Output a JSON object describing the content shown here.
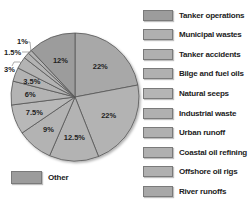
{
  "chart_data": {
    "type": "pie",
    "title": "",
    "categories": [
      "Tanker operations",
      "Municipal wastes",
      "Tanker accidents",
      "Bilge and fuel oils",
      "Natural seeps",
      "Industrial waste",
      "Urban runoff",
      "Coastal oil refining",
      "Offshore oil rigs",
      "River runoffs",
      "Other"
    ],
    "values": [
      22,
      22,
      12.5,
      9,
      7.5,
      6,
      3.5,
      3,
      1.5,
      1,
      12
    ],
    "labels": [
      "22%",
      "22%",
      "12.5%",
      "9%",
      "7.5%",
      "6%",
      "3.5%",
      "3%",
      "1.5%",
      "1%",
      "12%"
    ],
    "legend_position": "right",
    "colors": [
      "#a8a8a8",
      "#b3b3b3",
      "#b3b3b3",
      "#b3b3b3",
      "#b8b8b8",
      "#b3b3b3",
      "#b3b3b3",
      "#b3b3b3",
      "#b3b3b3",
      "#b3b3b3",
      "#9c9c9c"
    ]
  },
  "legend": {
    "items": [
      {
        "label": "Tanker operations",
        "color": "#9c9c9c"
      },
      {
        "label": "Municipal wastes",
        "color": "#b0b0b0"
      },
      {
        "label": "Tanker accidents",
        "color": "#b0b0b0"
      },
      {
        "label": "Bilge and fuel oils",
        "color": "#b0b0b0"
      },
      {
        "label": "Natural seeps",
        "color": "#b5b5b5"
      },
      {
        "label": "Industrial waste",
        "color": "#b0b0b0"
      },
      {
        "label": "Urban runoff",
        "color": "#b0b0b0"
      },
      {
        "label": "Coastal oil refining",
        "color": "#b0b0b0"
      },
      {
        "label": "Offshore oil rigs",
        "color": "#b0b0b0"
      },
      {
        "label": "River runoffs",
        "color": "#a8a8a8"
      }
    ],
    "other": {
      "label": "Other",
      "color": "#9c9c9c"
    }
  }
}
